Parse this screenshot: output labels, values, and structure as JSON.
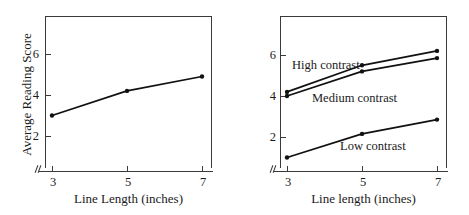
{
  "figure": {
    "panels": [
      {
        "id": "left",
        "y_axis_title": "Average Reading Score",
        "x_axis_title": "Line Length (inches)",
        "y_ticks": [
          "2",
          "4",
          "6"
        ],
        "x_ticks": [
          "3",
          "5",
          "7"
        ]
      },
      {
        "id": "right",
        "y_axis_title": "",
        "x_axis_title": "Line length (inches)",
        "y_ticks": [
          "2",
          "4",
          "6"
        ],
        "x_ticks": [
          "3",
          "5",
          "7"
        ]
      }
    ],
    "series_labels": {
      "high": "High contrast",
      "medium": "Medium contrast",
      "low": "Low contrast"
    },
    "colors": {
      "line": "#111111",
      "axis": "#3a3a3a",
      "background": "#ffffff"
    }
  },
  "chart_data": [
    {
      "type": "line",
      "title": "",
      "xlabel": "Line Length (inches)",
      "ylabel": "Average Reading Score",
      "x": [
        3,
        5,
        7
      ],
      "xtick_labels": [
        "3",
        "5",
        "7"
      ],
      "ytick_labels": [
        "2",
        "4",
        "6"
      ],
      "xlim": [
        2.4,
        7.6
      ],
      "ylim": [
        0.3,
        7.3
      ],
      "grid": false,
      "legend": "none",
      "axis_break": true,
      "series": [
        {
          "name": "Average Reading Score",
          "values": [
            3.0,
            4.2,
            4.9
          ]
        }
      ]
    },
    {
      "type": "line",
      "title": "",
      "xlabel": "Line length (inches)",
      "ylabel": "",
      "x": [
        3,
        5,
        7
      ],
      "xtick_labels": [
        "3",
        "5",
        "7"
      ],
      "ytick_labels": [
        "2",
        "4",
        "6"
      ],
      "xlim": [
        2.4,
        7.6
      ],
      "ylim": [
        0.3,
        7.3
      ],
      "grid": false,
      "legend": "inline-annotations",
      "axis_break": true,
      "series": [
        {
          "name": "High contrast",
          "values": [
            4.2,
            5.5,
            6.2
          ]
        },
        {
          "name": "Medium contrast",
          "values": [
            4.0,
            5.2,
            5.85
          ]
        },
        {
          "name": "Low contrast",
          "values": [
            1.0,
            2.15,
            2.85
          ]
        }
      ]
    }
  ]
}
